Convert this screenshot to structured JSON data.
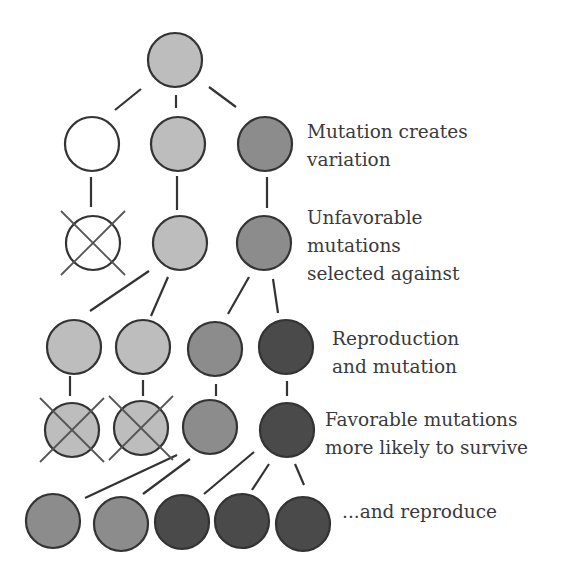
{
  "colors": {
    "light": "#bdbdbd",
    "medium": "#8c8c8c",
    "dark": "#4a4a4a",
    "white": "#ffffff",
    "stroke": "#333333",
    "cross": "#555555"
  },
  "nodes": [
    {
      "id": "n0",
      "cx": 175,
      "cy": 60,
      "shade": "light"
    },
    {
      "id": "n1",
      "cx": 92,
      "cy": 144,
      "shade": "white"
    },
    {
      "id": "n2",
      "cx": 178,
      "cy": 144,
      "shade": "light"
    },
    {
      "id": "n3",
      "cx": 265,
      "cy": 144,
      "shade": "medium"
    },
    {
      "id": "n4",
      "cx": 93,
      "cy": 243,
      "shade": "white",
      "crossed": true
    },
    {
      "id": "n5",
      "cx": 180,
      "cy": 243,
      "shade": "light"
    },
    {
      "id": "n6",
      "cx": 264,
      "cy": 243,
      "shade": "medium"
    },
    {
      "id": "n7",
      "cx": 74,
      "cy": 347,
      "shade": "light"
    },
    {
      "id": "n8",
      "cx": 143,
      "cy": 347,
      "shade": "light"
    },
    {
      "id": "n9",
      "cx": 215,
      "cy": 349,
      "shade": "medium"
    },
    {
      "id": "n10",
      "cx": 286,
      "cy": 347,
      "shade": "dark"
    },
    {
      "id": "n11",
      "cx": 72,
      "cy": 430,
      "shade": "light",
      "crossed": true
    },
    {
      "id": "n12",
      "cx": 141,
      "cy": 428,
      "shade": "light",
      "crossed": true
    },
    {
      "id": "n13",
      "cx": 210,
      "cy": 427,
      "shade": "medium"
    },
    {
      "id": "n14",
      "cx": 287,
      "cy": 430,
      "shade": "dark"
    },
    {
      "id": "n15",
      "cx": 53,
      "cy": 521,
      "shade": "medium"
    },
    {
      "id": "n16",
      "cx": 121,
      "cy": 524,
      "shade": "medium"
    },
    {
      "id": "n17",
      "cx": 182,
      "cy": 522,
      "shade": "dark"
    },
    {
      "id": "n18",
      "cx": 242,
      "cy": 521,
      "shade": "dark"
    },
    {
      "id": "n19",
      "cx": 303,
      "cy": 524,
      "shade": "dark"
    }
  ],
  "edges": [
    [
      141,
      89,
      115,
      110
    ],
    [
      176,
      95,
      176,
      108
    ],
    [
      209,
      87,
      236,
      107
    ],
    [
      91,
      177,
      91,
      207
    ],
    [
      177,
      176,
      177,
      210
    ],
    [
      267,
      177,
      267,
      208
    ],
    [
      149,
      271,
      90,
      311
    ],
    [
      168,
      277,
      151,
      316
    ],
    [
      249,
      277,
      228,
      314
    ],
    [
      273,
      279,
      278,
      313
    ],
    [
      70,
      376,
      70,
      396
    ],
    [
      143,
      380,
      143,
      396
    ],
    [
      216,
      384,
      216,
      396
    ],
    [
      287,
      381,
      287,
      396
    ],
    [
      177,
      455,
      85,
      498
    ],
    [
      190,
      459,
      143,
      494
    ],
    [
      254,
      452,
      204,
      494
    ],
    [
      269,
      464,
      252,
      490
    ],
    [
      295,
      464,
      304,
      485
    ]
  ],
  "labels": [
    {
      "id": "mutation-creates-variation",
      "x": 307,
      "y": 118,
      "lines": [
        "Mutation creates",
        "variation"
      ]
    },
    {
      "id": "unfavorable-selected-against",
      "x": 307,
      "y": 204,
      "lines": [
        "Unfavorable",
        "mutations",
        "selected against"
      ]
    },
    {
      "id": "reproduction-and-mutation",
      "x": 332,
      "y": 325,
      "lines": [
        "Reproduction",
        "and mutation"
      ]
    },
    {
      "id": "favorable-more-likely-survive",
      "x": 325,
      "y": 406,
      "lines": [
        "Favorable mutations",
        "more likely to survive"
      ]
    },
    {
      "id": "and-reproduce",
      "x": 342,
      "y": 498,
      "lines": [
        "...and reproduce"
      ]
    }
  ],
  "radius": 27
}
